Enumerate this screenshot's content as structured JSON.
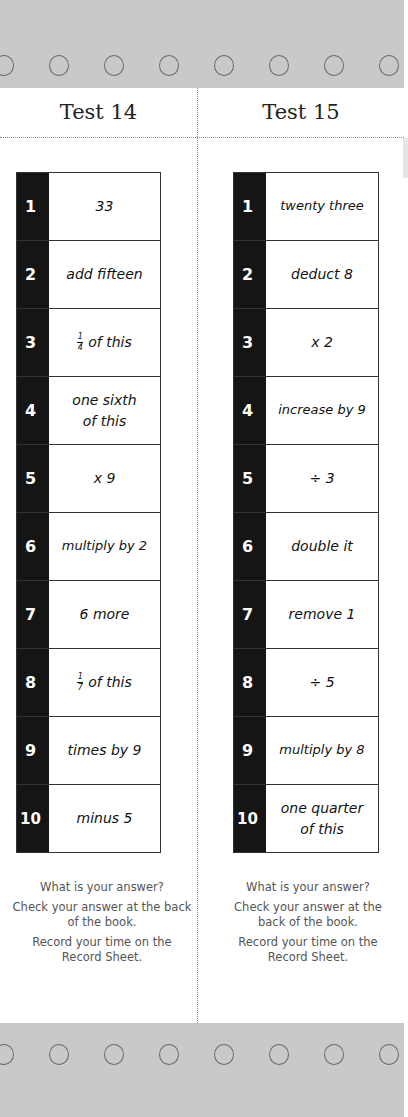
{
  "tests": [
    {
      "title": "Test 14",
      "rows": [
        {
          "n": "1",
          "op": "33"
        },
        {
          "n": "2",
          "op": "add fifteen"
        },
        {
          "n": "3",
          "op": "of this",
          "frac": {
            "num": "1",
            "den": "4"
          }
        },
        {
          "n": "4",
          "op": "one sixth of this"
        },
        {
          "n": "5",
          "op": "x 9"
        },
        {
          "n": "6",
          "op": "multiply by 2"
        },
        {
          "n": "7",
          "op": "6 more"
        },
        {
          "n": "8",
          "op": "of this",
          "frac": {
            "num": "1",
            "den": "7"
          }
        },
        {
          "n": "9",
          "op": "times by 9"
        },
        {
          "n": "10",
          "op": "minus 5"
        }
      ],
      "footer": {
        "q": "What is your answer?",
        "check": "Check your answer at the back of the book.",
        "record": "Record your time on the Record Sheet."
      }
    },
    {
      "title": "Test 15",
      "rows": [
        {
          "n": "1",
          "op": "twenty three"
        },
        {
          "n": "2",
          "op": "deduct 8"
        },
        {
          "n": "3",
          "op": "x 2"
        },
        {
          "n": "4",
          "op": "increase by 9"
        },
        {
          "n": "5",
          "op": "÷ 3"
        },
        {
          "n": "6",
          "op": "double it"
        },
        {
          "n": "7",
          "op": "remove 1"
        },
        {
          "n": "8",
          "op": "÷ 5"
        },
        {
          "n": "9",
          "op": "multiply by 8"
        },
        {
          "n": "10",
          "op": "one quarter of this"
        }
      ],
      "footer": {
        "q": "What is your answer?",
        "check": "Check your answer at the back of the book.",
        "record": "Record your time on the Record Sheet."
      }
    }
  ],
  "colors": {
    "band": "#c9c9c9",
    "number_column": "#151515"
  }
}
